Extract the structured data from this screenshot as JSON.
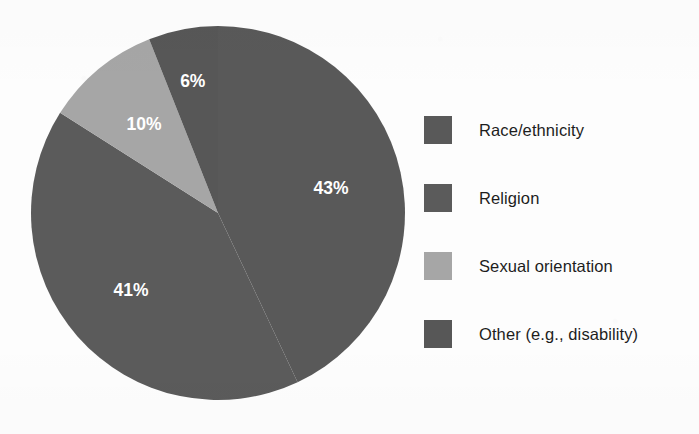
{
  "chart_data": {
    "type": "pie",
    "title": "",
    "categories": [
      "Race/ethnicity",
      "Religion",
      "Sexual orientation",
      "Other (e.g., disability)"
    ],
    "values": [
      43,
      41,
      10,
      6
    ],
    "value_labels": [
      "43%",
      "41%",
      "10%",
      "6%"
    ],
    "unit": "percent",
    "total": 100,
    "start_angle_deg": 0,
    "direction": "clockwise",
    "legend_position": "right",
    "grid": false,
    "colors": [
      "#595959",
      "#5b5b5b",
      "#a6a6a6",
      "#575757"
    ],
    "label_color": "#ffffff",
    "background": "#fdfdfd"
  },
  "legend": {
    "items": [
      {
        "label": "Race/ethnicity",
        "color": "#595959",
        "swatch_name": "legend-swatch-race-ethnicity"
      },
      {
        "label": "Religion",
        "color": "#5b5b5b",
        "swatch_name": "legend-swatch-religion"
      },
      {
        "label": "Sexual orientation",
        "color": "#a6a6a6",
        "swatch_name": "legend-swatch-sexual-orientation"
      },
      {
        "label": "Other (e.g., disability)",
        "color": "#575757",
        "swatch_name": "legend-swatch-other"
      }
    ]
  },
  "slices": [
    {
      "name": "Race/ethnicity",
      "percent": 43,
      "label": "43%",
      "color": "#595959"
    },
    {
      "name": "Religion",
      "percent": 41,
      "label": "41%",
      "color": "#5b5b5b"
    },
    {
      "name": "Sexual orientation",
      "percent": 10,
      "label": "10%",
      "color": "#a6a6a6"
    },
    {
      "name": "Other (e.g., disability)",
      "percent": 6,
      "label": "6%",
      "color": "#575757"
    }
  ]
}
